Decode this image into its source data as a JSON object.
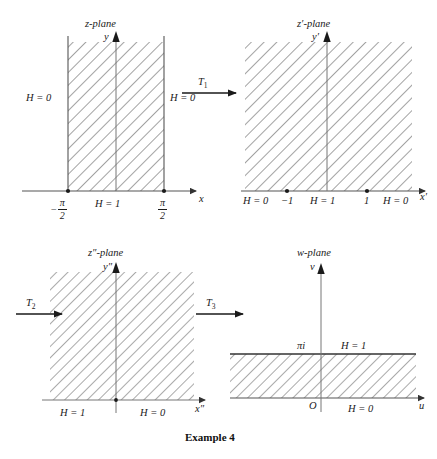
{
  "figure": {
    "caption": "Example 4",
    "panels": [
      {
        "id": "z-plane",
        "title": "z-plane",
        "y_axis_label": "y",
        "x_axis_label": "x",
        "region_description": "vertical strip -pi/2 < x < pi/2, y > 0, hatched",
        "labels": {
          "left_boundary": "H = 0",
          "right_boundary": "H = 0",
          "base": "H = 1",
          "tick_left_numer": "π",
          "tick_left_denom": "2",
          "tick_left_sign": "−",
          "tick_right_numer": "π",
          "tick_right_denom": "2"
        }
      },
      {
        "id": "z-prime-plane",
        "title": "z′-plane",
        "y_axis_label": "y′",
        "x_axis_label": "x′",
        "region_description": "upper half plane y' > 0, hatched",
        "labels": {
          "left_outer": "H = 0",
          "tick_minus_one": "−1",
          "center": "H = 1",
          "tick_one": "1",
          "right_outer": "H = 0"
        }
      },
      {
        "id": "z-double-prime-plane",
        "title": "z″-plane",
        "y_axis_label": "y″",
        "x_axis_label": "x″",
        "region_description": "upper half plane y'' > 0, hatched",
        "labels": {
          "left": "H = 1",
          "right": "H = 0"
        }
      },
      {
        "id": "w-plane",
        "title": "w-plane",
        "y_axis_label": "v",
        "x_axis_label": "u",
        "region_description": "horizontal strip 0 < v < pi, hatched",
        "labels": {
          "origin": "O",
          "strip_top_tick": "πi",
          "top_boundary": "H = 1",
          "bottom_boundary": "H = 0"
        }
      }
    ],
    "transformations": [
      {
        "id": "T1",
        "label": "T",
        "subscript": "1"
      },
      {
        "id": "T2",
        "label": "T",
        "subscript": "2"
      },
      {
        "id": "T3",
        "label": "T",
        "subscript": "3"
      }
    ],
    "colors": {
      "ink": "#1a1a1a",
      "axis": "#4a4a4a",
      "hatch": "#555555",
      "background": "#ffffff"
    }
  }
}
